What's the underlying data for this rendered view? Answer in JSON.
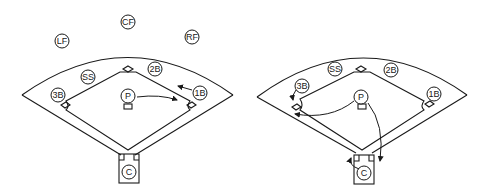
{
  "diagrams": [
    {
      "name": "left-field",
      "positions": {
        "LF": "LF",
        "CF": "CF",
        "RF": "RF",
        "SS": "SS",
        "2B": "2B",
        "3B": "3B",
        "1B": "1B",
        "P": "P",
        "C": "C"
      },
      "movement": "Pitcher covers first base; first baseman moves toward base"
    },
    {
      "name": "right-field",
      "positions": {
        "SS": "SS",
        "2B": "2B",
        "3B": "3B",
        "1B": "1B",
        "P": "P",
        "C": "C"
      },
      "movement": "Pitcher covers third base or home; catcher backs up; third baseman covers bag"
    }
  ],
  "colors": {
    "stroke": "#1a1a1a",
    "background": "#ffffff"
  }
}
